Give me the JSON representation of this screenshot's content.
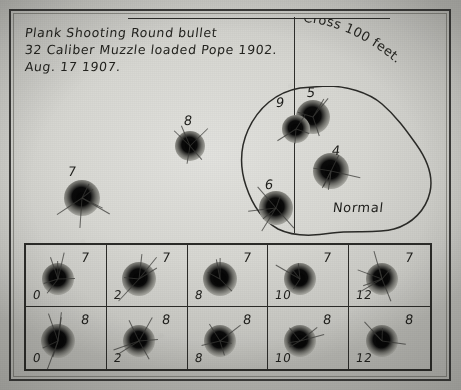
{
  "document": {
    "kind": "shooting-target-photograph",
    "title_lines": [
      "Plank Shooting Round bullet",
      "32 Caliber Muzzle loaded Pope 1902.",
      "Aug. 17 1907."
    ],
    "distance_note": "Cross 100 feet.",
    "group_caption": "Normal"
  },
  "loose_holes": [
    {
      "label": "7",
      "cx": 82,
      "cy": 198,
      "r": 18,
      "core": 11,
      "label_x": 68,
      "label_y": 164
    },
    {
      "label": "8",
      "cx": 190,
      "cy": 146,
      "r": 15,
      "core": 10,
      "label_x": 184,
      "label_y": 113
    }
  ],
  "group_holes": [
    {
      "label": "5",
      "cx": 313,
      "cy": 117,
      "r": 17,
      "core": 11,
      "label_x": 307,
      "label_y": 85
    },
    {
      "label": "9",
      "cx": 296,
      "cy": 129,
      "r": 14,
      "core": 10,
      "label_x": 276,
      "label_y": 95
    },
    {
      "label": "4",
      "cx": 331,
      "cy": 171,
      "r": 18,
      "core": 12,
      "label_x": 332,
      "label_y": 143
    },
    {
      "label": "6",
      "cx": 276,
      "cy": 208,
      "r": 17,
      "core": 11,
      "label_x": 265,
      "label_y": 177
    }
  ],
  "strip": {
    "row_labels": [
      "7",
      "8"
    ],
    "column_labels": [
      "0",
      "2",
      "8",
      "10",
      "12"
    ],
    "cells": [
      {
        "top": "7",
        "bottom": "0",
        "r": 16,
        "core": 10
      },
      {
        "top": "7",
        "bottom": "2",
        "r": 17,
        "core": 12
      },
      {
        "top": "7",
        "bottom": "8",
        "r": 17,
        "core": 13
      },
      {
        "top": "7",
        "bottom": "10",
        "r": 16,
        "core": 11
      },
      {
        "top": "7",
        "bottom": "12",
        "r": 16,
        "core": 12
      },
      {
        "top": "8",
        "bottom": "0",
        "r": 17,
        "core": 12
      },
      {
        "top": "8",
        "bottom": "2",
        "r": 16,
        "core": 12
      },
      {
        "top": "8",
        "bottom": "8",
        "r": 16,
        "core": 11
      },
      {
        "top": "8",
        "bottom": "10",
        "r": 16,
        "core": 12
      },
      {
        "top": "8",
        "bottom": "12",
        "r": 16,
        "core": 12
      }
    ]
  },
  "colors": {
    "ink": "#23231f",
    "paper": "#d7d7d2",
    "hole": "#060606",
    "frame": "#3a3a38"
  }
}
